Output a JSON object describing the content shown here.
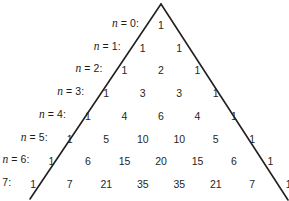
{
  "figure": {
    "line_color": "#231f20",
    "text_color": "#262626",
    "background": "#ffffff",
    "apex": {
      "x": 161,
      "y": 4
    },
    "row_height": 22.7,
    "first_row_baseline": 30,
    "cell_spacing": 36.5,
    "label_gap": 22
  },
  "chart_data": {
    "type": "table",
    "xlabel": "",
    "ylabel": "",
    "legend": [],
    "rows": [
      {
        "label_var": "n",
        "label_eq": " = 0:",
        "n": 0,
        "values": [
          1
        ]
      },
      {
        "label_var": "n",
        "label_eq": " = 1:",
        "n": 1,
        "values": [
          1,
          1
        ]
      },
      {
        "label_var": "n",
        "label_eq": " = 2:",
        "n": 2,
        "values": [
          1,
          2,
          1
        ]
      },
      {
        "label_var": "n",
        "label_eq": " = 3:",
        "n": 3,
        "values": [
          1,
          3,
          3,
          1
        ]
      },
      {
        "label_var": "n",
        "label_eq": " = 4:",
        "n": 4,
        "values": [
          1,
          4,
          6,
          4,
          1
        ]
      },
      {
        "label_var": "n",
        "label_eq": " = 5:",
        "n": 5,
        "values": [
          1,
          5,
          10,
          10,
          5,
          1
        ]
      },
      {
        "label_var": "n",
        "label_eq": " = 6:",
        "n": 6,
        "values": [
          1,
          6,
          15,
          20,
          15,
          6,
          1
        ]
      },
      {
        "label_var": "n",
        "label_eq": " = 7:",
        "n": 7,
        "values": [
          1,
          7,
          21,
          35,
          35,
          21,
          7,
          1
        ]
      }
    ]
  },
  "outline": {
    "left_edge": {
      "x1": 161,
      "y1": 4,
      "x2": 30,
      "y2": 199
    },
    "right_edge": {
      "x1": 161,
      "y1": 4,
      "x2": 288,
      "y2": 200
    },
    "stroke_width": 1.6
  }
}
